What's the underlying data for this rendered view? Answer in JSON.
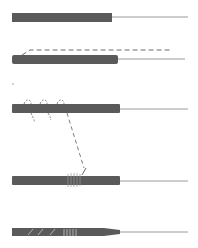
{
  "diagram": {
    "colors": {
      "background": "#ffffff",
      "sheath": "#5a5a5a",
      "needle": "#9a9a9a",
      "thread": "#6e6e6e",
      "highlight": "#d8d8d8"
    },
    "steps": [
      {
        "id": 1,
        "label": "",
        "sheath": {
          "x": 12,
          "y": 13,
          "w": 100,
          "h": 9
        },
        "needle_end": 188
      },
      {
        "id": 2,
        "label": "",
        "sheath": {
          "x": 12,
          "y": 55,
          "w": 106,
          "h": 9
        },
        "needle_end": 185,
        "thread": "dashed line above sheath"
      },
      {
        "id": 3,
        "label": "",
        "sheath": {
          "x": 12,
          "y": 104,
          "w": 108,
          "h": 9
        },
        "needle_end": 188,
        "thread": "three loops around sheath, trailing dashed tail"
      },
      {
        "id": 4,
        "label": "",
        "sheath": {
          "x": 12,
          "y": 176,
          "w": 108,
          "h": 9
        },
        "needle_end": 188,
        "thread": "coiled wrap at middle"
      },
      {
        "id": 5,
        "label": "",
        "sheath": {
          "x": 12,
          "y": 228,
          "w": 108,
          "h": 8
        },
        "needle_end": 188,
        "thread": "diagonal and vertical stripe wrapping, tapered tip"
      }
    ]
  }
}
